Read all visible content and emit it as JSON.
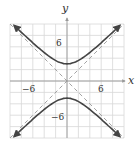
{
  "chart_data": {
    "type": "line",
    "title": "",
    "xlabel": "x",
    "ylabel": "y",
    "xlim": [
      -10,
      10
    ],
    "ylim": [
      -10,
      10
    ],
    "grid": true,
    "grid_step": 2,
    "x_tick_labels": [
      "-6",
      "6"
    ],
    "y_tick_labels": [
      "6",
      "-6"
    ],
    "series": [
      {
        "name": "hyperbola upper branch",
        "equation": "y^2/9 - x^2/9 = 1, y>0",
        "style": "solid",
        "vertex": [
          0,
          3
        ]
      },
      {
        "name": "hyperbola lower branch",
        "equation": "y^2/9 - x^2/9 = 1, y<0",
        "style": "solid",
        "vertex": [
          0,
          -3
        ]
      },
      {
        "name": "asymptote",
        "equation": "y = x",
        "style": "dashed"
      },
      {
        "name": "asymptote",
        "equation": "y = -x",
        "style": "dashed"
      }
    ]
  },
  "labels": {
    "x_axis": "x",
    "y_axis": "y",
    "x_neg": "−6",
    "x_pos": "6",
    "y_pos": "6",
    "y_neg": "−6"
  },
  "colors": {
    "grid": "#d8d8d8",
    "axis": "#999999",
    "curve": "#444444",
    "asymptote": "#999999"
  }
}
